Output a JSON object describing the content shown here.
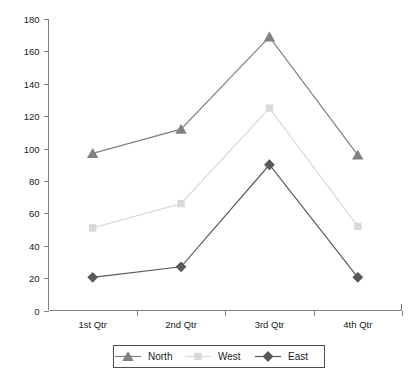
{
  "chart_data": {
    "type": "line",
    "title": "",
    "xlabel": "",
    "ylabel": "",
    "categories": [
      "1st Qtr",
      "2nd Qtr",
      "3rd Qtr",
      "4th Qtr"
    ],
    "ylim": [
      0,
      180
    ],
    "ytick_step": 20,
    "yticks": [
      0,
      20,
      40,
      60,
      80,
      100,
      120,
      140,
      160,
      180
    ],
    "grid": false,
    "legend_position": "bottom",
    "series": [
      {
        "name": "North",
        "marker": "triangle",
        "color": "#808080",
        "values": [
          97,
          112,
          169,
          96
        ]
      },
      {
        "name": "West",
        "marker": "square",
        "color": "#d9d9d9",
        "values": [
          51,
          66,
          125,
          52
        ]
      },
      {
        "name": "East",
        "marker": "diamond",
        "color": "#595959",
        "values": [
          20.5,
          27,
          90,
          20.5
        ]
      }
    ]
  },
  "axes": {
    "y_tick_labels": [
      "180",
      "160",
      "140",
      "120",
      "100",
      "80",
      "60",
      "40",
      "20",
      "0"
    ],
    "x_tick_labels": [
      "1st Qtr",
      "2nd Qtr",
      "3rd Qtr",
      "4th Qtr"
    ]
  },
  "legend": {
    "entries": [
      {
        "label": "North",
        "marker": "triangle",
        "color": "#808080"
      },
      {
        "label": "West",
        "marker": "square",
        "color": "#d9d9d9"
      },
      {
        "label": "East",
        "marker": "diamond",
        "color": "#595959"
      }
    ]
  },
  "colors": {
    "north": "#808080",
    "west": "#d9d9d9",
    "east": "#595959",
    "axis": "#808080",
    "legend_border": "#4d4d4d",
    "text": "#1a1a1a",
    "background": "#ffffff"
  }
}
